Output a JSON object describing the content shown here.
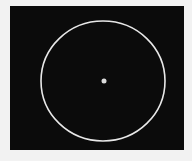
{
  "image": {
    "description": "Black field with a thin white circular ring and a small bright dot at its center",
    "colors": {
      "background": "#f2f2f2",
      "field": "#0b0b0b",
      "ring": "#e8e8e8",
      "dot": "#dcdcdc"
    },
    "ring": {
      "cx": 103,
      "cy": 81,
      "rx": 62,
      "ry": 60
    },
    "dot": {
      "cx": 104,
      "cy": 81,
      "r": 2.5
    }
  }
}
